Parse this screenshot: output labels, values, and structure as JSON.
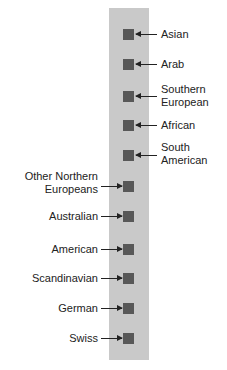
{
  "diagram": {
    "type": "vertical-scale-with-labeled-markers",
    "colors": {
      "bar": "#c9c9c9",
      "marker": "#585858",
      "arrow": "#222222",
      "text": "#222222"
    },
    "right_items": [
      {
        "lines": [
          "Asian"
        ],
        "marker_y": 29
      },
      {
        "lines": [
          "Arab"
        ],
        "marker_y": 59
      },
      {
        "lines": [
          "Southern",
          "European"
        ],
        "marker_y": 91
      },
      {
        "lines": [
          "African"
        ],
        "marker_y": 120
      },
      {
        "lines": [
          "South",
          "American"
        ],
        "marker_y": 150
      }
    ],
    "left_items": [
      {
        "lines": [
          "Other Northern",
          "Europeans"
        ],
        "marker_y": 181
      },
      {
        "lines": [
          "Australian"
        ],
        "marker_y": 211
      },
      {
        "lines": [
          "American"
        ],
        "marker_y": 244
      },
      {
        "lines": [
          "Scandinavian"
        ],
        "marker_y": 273
      },
      {
        "lines": [
          "German"
        ],
        "marker_y": 303
      },
      {
        "lines": [
          "Swiss"
        ],
        "marker_y": 333
      }
    ]
  }
}
